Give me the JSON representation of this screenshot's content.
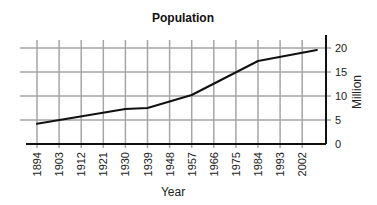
{
  "chart_data": {
    "type": "line",
    "title": "Population",
    "xlabel": "Year",
    "ylabel": "Million",
    "x_ticks": [
      "1894",
      "1903",
      "1912",
      "1921",
      "1930",
      "1939",
      "1948",
      "1957",
      "1966",
      "1975",
      "1984",
      "1993",
      "2002"
    ],
    "y_ticks": [
      "0",
      "5",
      "10",
      "15",
      "20"
    ],
    "ylim": [
      0,
      20
    ],
    "xlim": [
      1894,
      2010
    ],
    "grid": true,
    "y_axis_position": "right",
    "legend": null,
    "series": [
      {
        "name": "Population",
        "x": [
          1894,
          1930,
          1939,
          1957,
          1984,
          2008
        ],
        "values": [
          4.2,
          7.3,
          7.5,
          10.2,
          17.3,
          19.6
        ]
      }
    ]
  },
  "colors": {
    "line": "#111111",
    "grid": "#a6a6a6",
    "axis": "#111111"
  }
}
